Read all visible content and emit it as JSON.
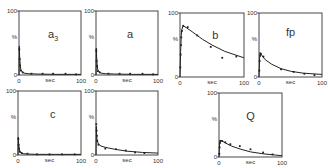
{
  "chart_data": [
    {
      "type": "scatter",
      "panel_label": "a3",
      "panel_label_main": "a",
      "panel_label_sub": "3",
      "xlabel": "sec",
      "ylabel": "%",
      "xlim": [
        0,
        100
      ],
      "ylim": [
        0,
        100
      ],
      "x_ticks": [
        "0",
        "100"
      ],
      "y_ticks": [
        "0",
        "100"
      ],
      "curve": {
        "x": [
          0,
          0.5,
          1,
          2,
          3,
          5,
          8,
          15,
          30,
          60,
          100
        ],
        "y": [
          0,
          45,
          30,
          15,
          8,
          5,
          3,
          2,
          1.5,
          1,
          1
        ]
      },
      "points": {
        "x": [
          0.5,
          1,
          1.5,
          3,
          6,
          20,
          38,
          55,
          75,
          92
        ],
        "y": [
          40,
          25,
          15,
          7,
          4,
          2,
          2,
          2,
          2,
          1
        ]
      }
    },
    {
      "type": "scatter",
      "panel_label": "a",
      "panel_label_main": "a",
      "panel_label_sub": "",
      "xlabel": "sec",
      "ylabel": "%",
      "xlim": [
        0,
        100
      ],
      "ylim": [
        0,
        100
      ],
      "x_ticks": [
        "0",
        "100"
      ],
      "y_ticks": [
        "0",
        "100"
      ],
      "curve": {
        "x": [
          0,
          0.5,
          1,
          2,
          3,
          5,
          8,
          15,
          30,
          60,
          100
        ],
        "y": [
          0,
          42,
          28,
          14,
          8,
          5,
          3,
          2,
          1.5,
          1,
          1
        ]
      },
      "points": {
        "x": [
          0.5,
          1,
          1.5,
          3,
          6,
          20,
          38,
          55,
          75,
          92
        ],
        "y": [
          38,
          22,
          14,
          6,
          4,
          2,
          2,
          2,
          2,
          1
        ]
      }
    },
    {
      "type": "scatter",
      "panel_label": "b",
      "panel_label_main": "b",
      "panel_label_sub": "",
      "xlabel": "sec",
      "ylabel": "%",
      "xlim": [
        0,
        100
      ],
      "ylim": [
        0,
        100
      ],
      "x_ticks": [
        "0",
        "100"
      ],
      "y_ticks": [
        "0",
        "100"
      ],
      "curve": {
        "x": [
          0,
          1,
          2,
          3,
          5,
          10,
          20,
          35,
          50,
          70,
          100
        ],
        "y": [
          0,
          40,
          65,
          75,
          80,
          77,
          70,
          59,
          50,
          40,
          30
        ]
      },
      "points": {
        "x": [
          0.5,
          1,
          1.5,
          2,
          3,
          5,
          12,
          27,
          48,
          66,
          88
        ],
        "y": [
          15,
          35,
          50,
          62,
          72,
          80,
          78,
          65,
          47,
          30,
          32
        ]
      }
    },
    {
      "type": "scatter",
      "panel_label": "fp",
      "panel_label_main": "fp",
      "panel_label_sub": "",
      "xlabel": "sec",
      "ylabel": "%",
      "xlim": [
        0,
        100
      ],
      "ylim": [
        0,
        100
      ],
      "x_ticks": [
        "0",
        "100"
      ],
      "y_ticks": [
        "0",
        "100"
      ],
      "curve": {
        "x": [
          0,
          1,
          2,
          5,
          10,
          20,
          35,
          50,
          70,
          100
        ],
        "y": [
          0,
          30,
          37,
          33,
          27,
          20,
          13,
          9,
          6,
          4
        ]
      },
      "points": {
        "x": [
          0.5,
          1,
          1.5,
          2,
          3,
          7,
          35,
          55,
          72,
          88
        ],
        "y": [
          10,
          25,
          33,
          37,
          36,
          32,
          12,
          8,
          5,
          3
        ]
      }
    },
    {
      "type": "scatter",
      "panel_label": "c",
      "panel_label_main": "c",
      "panel_label_sub": "",
      "xlabel": "sec",
      "ylabel": "%",
      "xlim": [
        0,
        100
      ],
      "ylim": [
        0,
        100
      ],
      "x_ticks": [
        "0",
        "100"
      ],
      "y_ticks": [
        "0",
        "100"
      ],
      "curve": {
        "x": [
          0,
          0.5,
          1,
          2,
          3,
          5,
          8,
          15,
          30,
          60,
          100
        ],
        "y": [
          0,
          28,
          18,
          9,
          5,
          3,
          2,
          1.5,
          1,
          1,
          1
        ]
      },
      "points": {
        "x": [
          0.5,
          1,
          1.5,
          3,
          6,
          15,
          30,
          50,
          70,
          90
        ],
        "y": [
          25,
          16,
          10,
          5,
          3,
          2,
          1,
          1,
          1,
          1
        ]
      }
    },
    {
      "type": "scatter",
      "panel_label": "",
      "panel_label_main": "",
      "panel_label_sub": "",
      "xlabel": "sec",
      "ylabel": "%",
      "xlim": [
        0,
        100
      ],
      "ylim": [
        0,
        100
      ],
      "x_ticks": [
        "0",
        "100"
      ],
      "y_ticks": [
        "0",
        "100"
      ],
      "curve": {
        "x": [
          0,
          0.5,
          1,
          2,
          4,
          8,
          15,
          30,
          50,
          75,
          100
        ],
        "y": [
          0,
          45,
          30,
          22,
          17,
          14,
          12,
          9,
          6,
          4,
          3
        ]
      },
      "points": {
        "x": [
          0.5,
          1,
          1.5,
          2,
          4,
          15,
          32,
          48,
          63,
          78
        ],
        "y": [
          48,
          38,
          30,
          22,
          16,
          10,
          9,
          7,
          4,
          3
        ]
      }
    },
    {
      "type": "scatter",
      "panel_label": "Q",
      "panel_label_main": "Q",
      "panel_label_sub": "",
      "xlabel": "sec",
      "ylabel": "%",
      "xlim": [
        0,
        100
      ],
      "ylim": [
        0,
        100
      ],
      "x_ticks": [
        "0",
        "100"
      ],
      "y_ticks": [
        "0",
        "100"
      ],
      "curve": {
        "x": [
          0,
          1,
          2,
          5,
          10,
          20,
          35,
          50,
          70,
          100
        ],
        "y": [
          0,
          22,
          26,
          25,
          22,
          17,
          12,
          8,
          5,
          2
        ]
      },
      "points": {
        "x": [
          0.5,
          1,
          1.5,
          2,
          5,
          10,
          18,
          33,
          50,
          70,
          85
        ],
        "y": [
          5,
          15,
          22,
          25,
          25,
          23,
          20,
          17,
          12,
          7,
          4
        ]
      }
    }
  ]
}
